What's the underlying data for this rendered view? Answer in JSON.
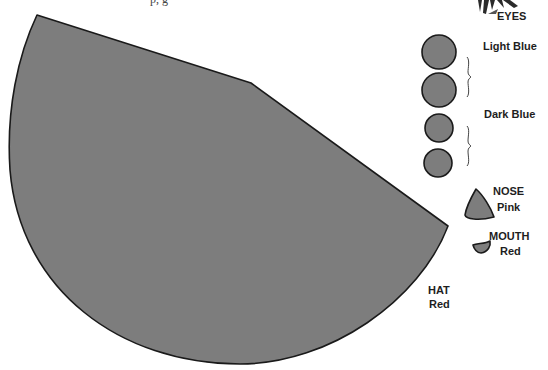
{
  "header": {
    "cutoff_text": "p,   g"
  },
  "colors": {
    "fill": "#7d7d7d",
    "stroke": "#1a1a1a",
    "text": "#1e1e1e",
    "background": "#ffffff"
  },
  "parts": {
    "hat": {
      "title": "HAT",
      "color": "Red"
    },
    "eyes": {
      "title": "EYES",
      "groups": [
        {
          "color": "Light Blue",
          "count": 2
        },
        {
          "color": "Dark Blue",
          "count": 2
        }
      ]
    },
    "nose": {
      "title": "NOSE",
      "color": "Pink"
    },
    "mouth": {
      "title": "MOUTH",
      "color": "Red"
    }
  },
  "decoration": {
    "top_right": "feather-tassel"
  }
}
